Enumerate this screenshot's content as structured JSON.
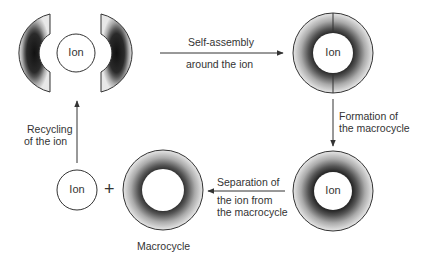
{
  "nodes": {
    "split_halves": {
      "ion_label": "Ion"
    },
    "assembled": {
      "ion_label": "Ion"
    },
    "macrocycle_with_ion": {
      "ion_label": "Ion"
    },
    "free_ion": {
      "ion_label": "Ion"
    },
    "free_macrocycle": {
      "caption": "Macrocycle"
    }
  },
  "operator": {
    "plus": "+"
  },
  "steps": [
    {
      "id": "self_assembly",
      "line1": "Self-assembly",
      "line2": "around the ion"
    },
    {
      "id": "formation",
      "line1": "Formation of",
      "line2": "the macrocycle"
    },
    {
      "id": "separation",
      "line1": "Separation of",
      "line2": "the ion from",
      "line3": "the macrocycle"
    },
    {
      "id": "recycling",
      "line1": "Recycling",
      "line2": "of the ion"
    }
  ],
  "colors": {
    "ring_dark": "#2e2e2e",
    "ring_light": "#e6e6e6",
    "stroke": "#333333",
    "background": "#ffffff"
  }
}
